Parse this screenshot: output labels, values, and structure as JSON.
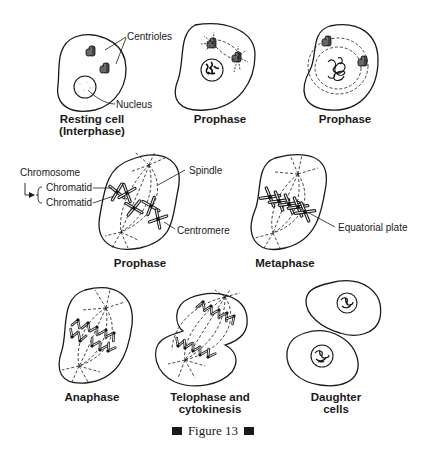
{
  "figure": {
    "caption": "Figure 13",
    "stages": [
      {
        "id": "interphase",
        "label_line1": "Resting cell",
        "label_line2": "(Interphase)"
      },
      {
        "id": "prophase-early",
        "label_line1": "Prophase"
      },
      {
        "id": "prophase-mid",
        "label_line1": "Prophase"
      },
      {
        "id": "prophase-late",
        "label_line1": "Prophase"
      },
      {
        "id": "metaphase",
        "label_line1": "Metaphase"
      },
      {
        "id": "anaphase",
        "label_line1": "Anaphase"
      },
      {
        "id": "telophase",
        "label_line1": "Telophase and",
        "label_line2": "cytokinesis"
      },
      {
        "id": "daughter",
        "label_line1": "Daughter",
        "label_line2": "cells"
      }
    ],
    "annotations": {
      "centrioles": "Centrioles",
      "nucleus": "Nucleus",
      "chromosome": "Chromosome",
      "chromatid_1": "Chromatid",
      "chromatid_2": "Chromatid",
      "spindle": "Spindle",
      "centromere": "Centromere",
      "equatorial_plate": "Equatorial plate"
    }
  }
}
